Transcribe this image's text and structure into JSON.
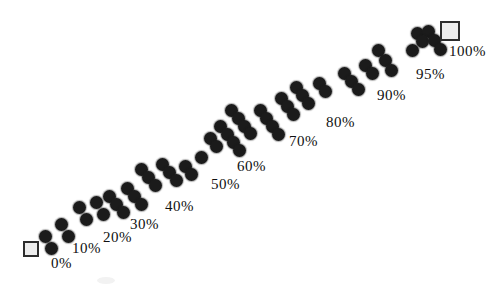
{
  "figure": {
    "width": 498,
    "height": 288,
    "background": "#ffffff",
    "dot_color": "#1b1b1b",
    "dot_diameter": 13,
    "square_fill": "#ededed",
    "square_border_color": "#2d2d2d",
    "label_color": "#101010",
    "label_font_size": 15
  },
  "chart_data": {
    "type": "scatter",
    "legend": "none",
    "grid": "off",
    "tick_labels": [
      "0%",
      "10%",
      "20%",
      "30%",
      "40%",
      "50%",
      "60%",
      "70%",
      "80%",
      "90%",
      "95%",
      "100%"
    ],
    "points": [
      [
        45,
        236
      ],
      [
        51,
        248
      ],
      [
        61,
        224
      ],
      [
        68,
        236
      ],
      [
        79,
        207
      ],
      [
        86,
        219
      ],
      [
        96,
        202
      ],
      [
        103,
        214
      ],
      [
        109,
        196
      ],
      [
        116,
        204
      ],
      [
        123,
        212
      ],
      [
        127,
        188
      ],
      [
        134,
        196
      ],
      [
        141,
        204
      ],
      [
        141,
        169
      ],
      [
        148,
        177
      ],
      [
        155,
        185
      ],
      [
        162,
        164
      ],
      [
        169,
        172
      ],
      [
        176,
        180
      ],
      [
        185,
        166
      ],
      [
        191,
        174
      ],
      [
        201,
        157
      ],
      [
        210,
        138
      ],
      [
        216,
        146
      ],
      [
        220,
        126
      ],
      [
        227,
        134
      ],
      [
        233,
        142
      ],
      [
        239,
        150
      ],
      [
        231,
        110
      ],
      [
        238,
        118
      ],
      [
        244,
        126
      ],
      [
        250,
        133
      ],
      [
        260,
        110
      ],
      [
        266,
        118
      ],
      [
        272,
        126
      ],
      [
        278,
        134
      ],
      [
        281,
        98
      ],
      [
        287,
        106
      ],
      [
        293,
        114
      ],
      [
        296,
        87
      ],
      [
        302,
        95
      ],
      [
        308,
        103
      ],
      [
        319,
        83
      ],
      [
        325,
        91
      ],
      [
        344,
        73
      ],
      [
        351,
        81
      ],
      [
        358,
        89
      ],
      [
        365,
        65
      ],
      [
        372,
        73
      ],
      [
        378,
        50
      ],
      [
        385,
        60
      ],
      [
        391,
        70
      ],
      [
        412,
        50
      ],
      [
        417,
        33
      ],
      [
        428,
        31
      ],
      [
        422,
        41
      ],
      [
        434,
        40
      ],
      [
        440,
        49
      ]
    ],
    "labels": [
      {
        "text": "0%",
        "x": 51,
        "y": 256
      },
      {
        "text": "10%",
        "x": 72,
        "y": 241
      },
      {
        "text": "20%",
        "x": 103,
        "y": 230
      },
      {
        "text": "30%",
        "x": 130,
        "y": 217
      },
      {
        "text": "40%",
        "x": 165,
        "y": 199
      },
      {
        "text": "50%",
        "x": 211,
        "y": 177
      },
      {
        "text": "60%",
        "x": 237,
        "y": 159
      },
      {
        "text": "70%",
        "x": 289,
        "y": 134
      },
      {
        "text": "80%",
        "x": 326,
        "y": 115
      },
      {
        "text": "90%",
        "x": 377,
        "y": 88
      },
      {
        "text": "95%",
        "x": 416,
        "y": 67
      },
      {
        "text": "100%",
        "x": 449,
        "y": 44
      }
    ],
    "endpoint_squares": [
      {
        "label": "0%",
        "x": 23,
        "y": 241,
        "size": 16
      },
      {
        "label": "100%",
        "x": 440,
        "y": 21,
        "size": 20
      }
    ],
    "artifact": {
      "x": 97,
      "y": 277,
      "width": 18,
      "height": 7
    }
  }
}
